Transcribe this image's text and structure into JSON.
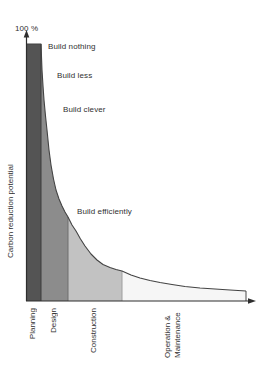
{
  "chart_data": {
    "type": "area",
    "title": "",
    "ylabel": "Carbon reduction potential",
    "y_top_label": "100 %",
    "x_categories": [
      "Planning",
      "Design",
      "Construction",
      "Operation & Maintenance"
    ],
    "annotations": [
      "Build nothing",
      "Build less",
      "Build clever",
      "Build efficiently"
    ],
    "legend": "none",
    "grid": false,
    "ylim_pct": [
      0,
      100
    ],
    "segments": [
      {
        "phase": "Planning",
        "color": "#545454",
        "pct_start": 100,
        "pct_end": 100,
        "x0": 26,
        "x1": 41
      },
      {
        "phase": "Design",
        "color": "#8c8c8c",
        "pct_start": 100,
        "pct_end": 33,
        "x0": 41,
        "x1": 68
      },
      {
        "phase": "Construction",
        "color": "#c2c2c2",
        "pct_start": 33,
        "pct_end": 12,
        "x0": 68,
        "x1": 122
      },
      {
        "phase": "Operation & Maintenance",
        "color": "#f6f6f6",
        "pct_start": 12,
        "pct_end": 4,
        "x0": 122,
        "x1": 246
      }
    ],
    "curve_points": [
      [
        26,
        44
      ],
      [
        41,
        44
      ],
      [
        42,
        70
      ],
      [
        43,
        86
      ],
      [
        44,
        100
      ],
      [
        45.5,
        116
      ],
      [
        47,
        130
      ],
      [
        49,
        150
      ],
      [
        51,
        165
      ],
      [
        53.5,
        179
      ],
      [
        56,
        190
      ],
      [
        59,
        199
      ],
      [
        62,
        206
      ],
      [
        65,
        212
      ],
      [
        68,
        217
      ],
      [
        72,
        225
      ],
      [
        76,
        231
      ],
      [
        80.5,
        239
      ],
      [
        85,
        246
      ],
      [
        91,
        254
      ],
      [
        97,
        260
      ],
      [
        103,
        264.5
      ],
      [
        110,
        267.5
      ],
      [
        116,
        269.5
      ],
      [
        122,
        271
      ],
      [
        131,
        275
      ],
      [
        140,
        278
      ],
      [
        150,
        280.5
      ],
      [
        160,
        282.5
      ],
      [
        172,
        284.5
      ],
      [
        185,
        286.5
      ],
      [
        200,
        288
      ],
      [
        215,
        289
      ],
      [
        230,
        290
      ],
      [
        246,
        291
      ]
    ],
    "axis": {
      "baseline_y": 301,
      "y_axis_x": 26.5,
      "y_axis_top": 36,
      "y_arrow_tip": 30,
      "x_axis_end": 249,
      "x_arrow_tip": 256,
      "axis_color": "#2e2e2e",
      "curve_color": "#434343"
    },
    "dividers": [
      {
        "x": 41,
        "color": "#3c3c3c"
      },
      {
        "x": 68,
        "color": "#6f6f6f"
      },
      {
        "x": 122,
        "color": "#9e9e9e"
      },
      {
        "x": 246,
        "color": "#4a4a4a"
      }
    ]
  }
}
